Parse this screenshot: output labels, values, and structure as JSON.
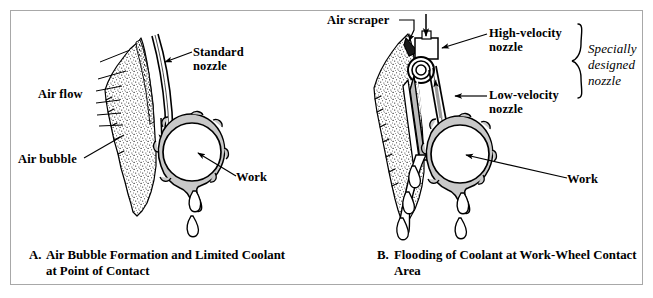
{
  "figure": {
    "panels": [
      {
        "id": "panel-a",
        "caption_letter": "A.",
        "caption_line1": "Air Bubble Formation and Limited Coolant",
        "caption_line2": "at Point of Contact",
        "labels": [
          {
            "name": "standard-nozzle",
            "line1": "Standard",
            "line2": "nozzle"
          },
          {
            "name": "air-flow",
            "line1": "Air flow",
            "line2": ""
          },
          {
            "name": "air-bubble",
            "line1": "Air bubble",
            "line2": ""
          },
          {
            "name": "work",
            "line1": "Work",
            "line2": ""
          }
        ]
      },
      {
        "id": "panel-b",
        "caption_letter": "B.",
        "caption_line1": "Flooding of Coolant at Work-Wheel Contact",
        "caption_line2": "Area",
        "labels": [
          {
            "name": "air-scraper",
            "line1": "Air scraper",
            "line2": ""
          },
          {
            "name": "high-velocity-nozzle",
            "line1": "High-velocity",
            "line2": "nozzle"
          },
          {
            "name": "low-velocity-nozzle",
            "line1": "Low-velocity",
            "line2": "nozzle"
          },
          {
            "name": "specially-designed-nozzle",
            "line1": "Specially",
            "line2": "designed",
            "line3": "nozzle"
          },
          {
            "name": "work",
            "line1": "Work",
            "line2": ""
          }
        ]
      }
    ],
    "colors": {
      "ink": "#000000",
      "coolant_fill": "#c9c9c9",
      "wheel_fill": "#ffffff",
      "border": "#a8a8a8",
      "page": "#ffffff"
    }
  }
}
